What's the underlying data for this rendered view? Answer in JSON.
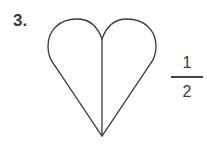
{
  "problem": {
    "number_label": "3.",
    "shape": "heart",
    "parts_total": 2,
    "fraction": {
      "numerator": "1",
      "denominator": "2"
    }
  }
}
